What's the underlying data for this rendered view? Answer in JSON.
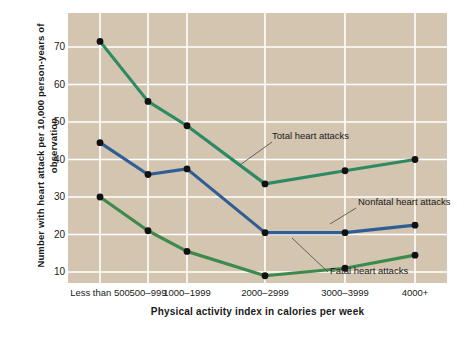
{
  "chart_data": {
    "type": "line",
    "title": "",
    "xlabel": "Physical activity index in calories per week",
    "ylabel": "Number with heart attack per 10,000 person-years of observation",
    "categories": [
      "Less than 500",
      "500–999",
      "1000–1999",
      "2000–2999",
      "3000–3999",
      "4000+"
    ],
    "ylim": [
      0,
      75
    ],
    "yticks": [
      70,
      60,
      50,
      40,
      30,
      20,
      10
    ],
    "grid": true,
    "legend_position": "inline-annotations",
    "plot_background": "#d3c5b0",
    "gridline_color": "#ffffff",
    "marker_color": "#111111",
    "series": [
      {
        "name": "Total heart attacks",
        "color": "#2d8a62",
        "values": [
          71.5,
          55.5,
          49,
          33.5,
          37,
          40
        ]
      },
      {
        "name": "Nonfatal heart attacks",
        "color": "#2f5d96",
        "values": [
          44.5,
          36,
          37.5,
          20.5,
          20.5,
          22.5
        ]
      },
      {
        "name": "Fatal heart attacks",
        "color": "#3d8a4e",
        "values": [
          30,
          21,
          15.5,
          9,
          11,
          14.5
        ]
      }
    ],
    "annotations": [
      {
        "text": "Total heart attacks",
        "series": "Total heart attacks"
      },
      {
        "text": "Nonfatal heart attacks",
        "series": "Nonfatal heart attacks"
      },
      {
        "text": "Fatal heart attacks",
        "series": "Fatal heart attacks"
      }
    ]
  }
}
